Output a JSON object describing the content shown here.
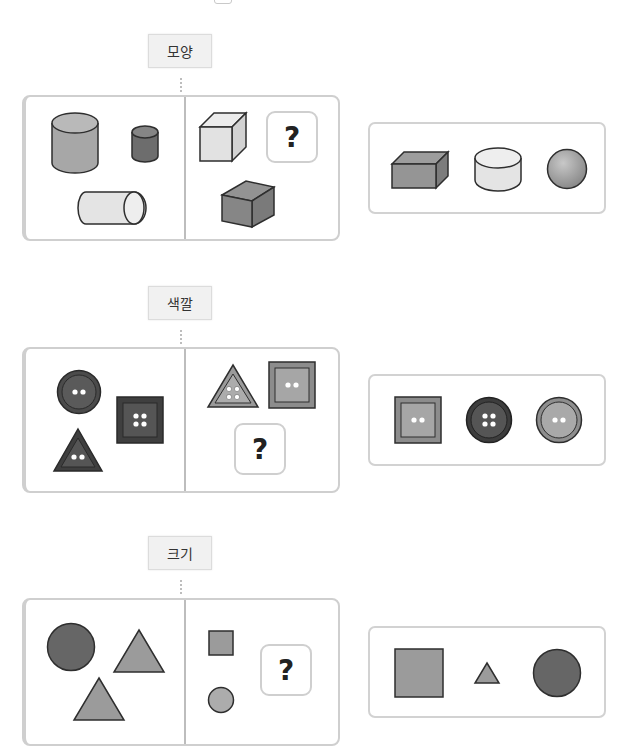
{
  "colors": {
    "stroke": "#2e2e2e",
    "box_border": "#cfcfcf",
    "tag_bg": "#f1f1f1",
    "dark": "#555555",
    "mid": "#8e8e8e",
    "light": "#c4c4c4",
    "pale": "#e6e6e6"
  },
  "sections": [
    {
      "id": "shape",
      "tag_label": "모양",
      "question_mark": "?",
      "left_group": [
        "large-cylinder",
        "small-dark-cylinder",
        "lying-cylinder"
      ],
      "right_group": [
        "light-cube",
        "dark-box"
      ],
      "choices": [
        "rectangular-box",
        "short-cylinder",
        "sphere"
      ]
    },
    {
      "id": "color",
      "tag_label": "색깔",
      "question_mark": "?",
      "left_group": [
        "dark-round-button",
        "dark-square-button",
        "dark-triangle-button"
      ],
      "right_group": [
        "light-triangle-button",
        "light-square-button"
      ],
      "choices": [
        "light-square-button",
        "dark-round-button",
        "light-round-button"
      ]
    },
    {
      "id": "size",
      "tag_label": "크기",
      "question_mark": "?",
      "left_group": [
        "large-circle",
        "large-triangle",
        "large-triangle"
      ],
      "right_group": [
        "small-square",
        "small-circle"
      ],
      "choices": [
        "large-square",
        "small-triangle",
        "large-circle"
      ]
    }
  ]
}
